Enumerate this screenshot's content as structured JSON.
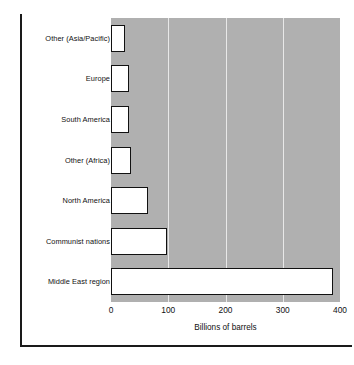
{
  "chart_data": {
    "type": "bar",
    "orientation": "horizontal",
    "title": "",
    "xlabel": "Billions of barrels",
    "ylabel": "",
    "xlim": [
      0,
      400
    ],
    "xticks": [
      0,
      100,
      200,
      300,
      400
    ],
    "xtick_labels": [
      "0",
      "100",
      "200",
      "300",
      "400"
    ],
    "grid": true,
    "grid_axis": "x",
    "legend": false,
    "categories": [
      "Other (Asia/Pacific)",
      "Europe",
      "South America",
      "Other (Africa)",
      "North America",
      "Communist nations",
      "Middle East region"
    ],
    "values": [
      25,
      32,
      32,
      35,
      65,
      98,
      388
    ],
    "plot_background_color": "#b0b0b0",
    "bar_fill_color": "#ffffff",
    "bar_edge_color": "#111111",
    "grid_color": "#e8e8e8"
  }
}
